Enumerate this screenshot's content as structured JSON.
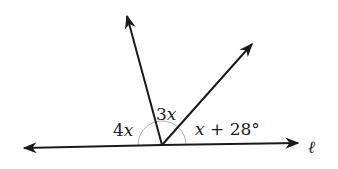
{
  "diagram": {
    "type": "angles-on-a-line",
    "line_label": "ℓ",
    "angles": [
      {
        "id": "left",
        "coef": "4",
        "var": "x",
        "const": ""
      },
      {
        "id": "middle",
        "coef": "3",
        "var": "x",
        "const": ""
      },
      {
        "id": "right",
        "coef": "",
        "var": "x",
        "const": " + 28°"
      }
    ],
    "colors": {
      "line": "#1a1a1a",
      "arc": "#b0b0b0",
      "text": "#222222",
      "background": "#ffffff"
    }
  }
}
